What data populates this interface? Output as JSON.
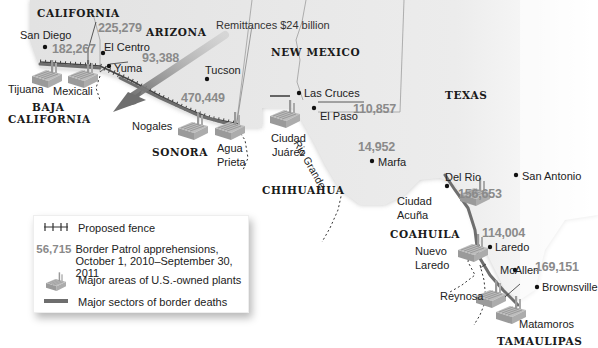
{
  "map": {
    "title": "U.S.–Mexico border",
    "states_us": [
      "CALIFORNIA",
      "ARIZONA",
      "NEW MEXICO",
      "TEXAS"
    ],
    "states_mx": [
      "BAJA CALIFORNIA",
      "SONORA",
      "CHIHUAHUA",
      "COAHUILA",
      "TAMAULIPAS"
    ],
    "labels": {
      "california": "CALIFORNIA",
      "arizona": "ARIZONA",
      "new_mexico": "NEW MEXICO",
      "texas": "TEXAS",
      "baja_1": "BAJA",
      "baja_2": "CALIFORNIA",
      "sonora": "SONORA",
      "chihuahua": "CHIHUAHUA",
      "coahuila": "COAHUILA",
      "tamaulipas": "TAMAULIPAS"
    },
    "cities": {
      "san_diego": "San Diego",
      "el_centro": "El Centro",
      "yuma": "Yuma",
      "tucson": "Tucson",
      "las_cruces": "Las Cruces",
      "el_paso": "El Paso",
      "marfa": "Marfa",
      "del_rio": "Del Rio",
      "san_antonio": "San Antonio",
      "laredo": "Laredo",
      "mcallen": "McAllen",
      "brownsville": "Brownsville",
      "tijuana": "Tijuana",
      "mexicali": "Mexicali",
      "nogales": "Nogales",
      "agua_prieta_1": "Agua",
      "agua_prieta_2": "Prieta",
      "ciudad_juarez_1": "Ciudad",
      "ciudad_juarez_2": "Juárez",
      "ciudad_acuna_1": "Ciudad",
      "ciudad_acuna_2": "Acuña",
      "nuevo_laredo_1": "Nuevo",
      "nuevo_laredo_2": "Laredo",
      "reynosa": "Reynosa",
      "matamoros": "Matamoros"
    },
    "river": "Rio Grande",
    "remittances": "Remittances $24 billion",
    "apprehensions": {
      "san_diego": "182,267",
      "el_centro": "225,279",
      "yuma": "93,388",
      "tucson": "470,449",
      "el_paso": "110,857",
      "marfa": "14,952",
      "del_rio": "156,653",
      "laredo": "114,004",
      "rio_grande_valley": "169,151"
    },
    "colors": {
      "us_land": "#e3e3e3",
      "mx_land": "#ffffff",
      "number_gray": "#8a8a8a",
      "border_deaths": "#6e6e6e",
      "arrow": "#7a7a7a"
    }
  },
  "legend": {
    "items": [
      {
        "symbol": "fence-icon",
        "label": "Proposed fence"
      },
      {
        "symbol": "56,715",
        "label_1": "Border Patrol apprehensions,",
        "label_2": "October 1, 2010–September 30, 2011"
      },
      {
        "symbol": "plant-icon",
        "label": "Major areas of U.S.-owned plants"
      },
      {
        "symbol": "deaths-bar-icon",
        "label": "Major sectors of border deaths"
      }
    ]
  }
}
